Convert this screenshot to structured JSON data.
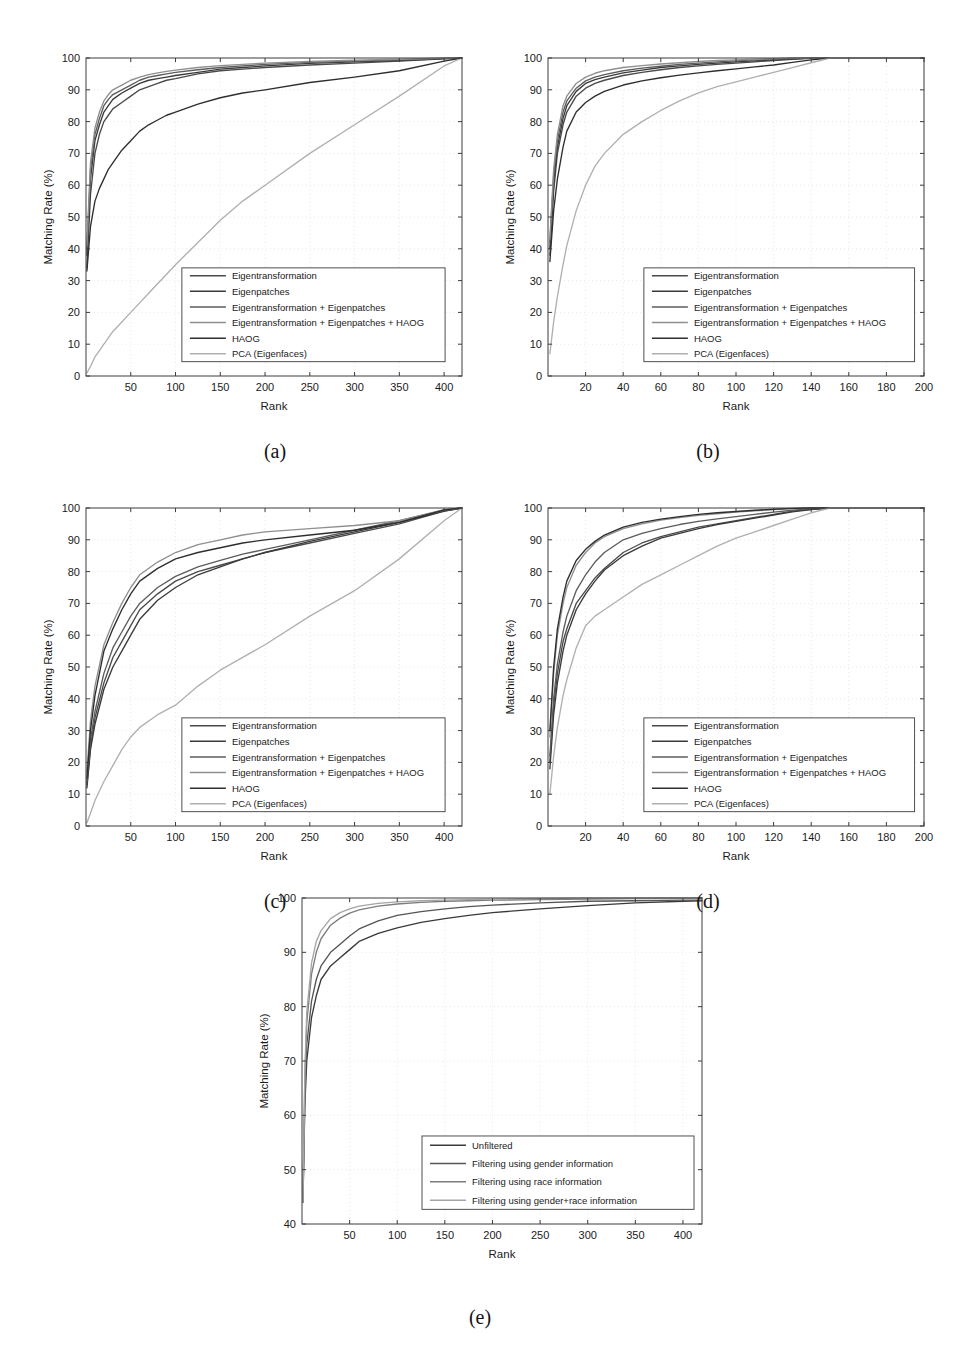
{
  "figure": {
    "background": "#ffffff",
    "axis_color": "#3c3c3c",
    "grid_color": "#d8d8d8",
    "text_color": "#1a1a1a"
  },
  "captions": {
    "a": "(a)",
    "b": "(b)",
    "c": "(c)",
    "d": "(d)",
    "e": "(e)"
  },
  "series_colors": {
    "eigentransformation": "#4a4a4a",
    "eigenpatches": "#3a3a3a",
    "eigentransformation_eigenpatches": "#5c5c5c",
    "eigentransformation_eigenpatches_haog": "#8f8f8f",
    "haog": "#2e2e2e",
    "pca_eigenfaces": "#b0b0b0",
    "unfiltered": "#3a3a3a",
    "gender": "#555555",
    "race": "#7d7d7d",
    "gender_race": "#a5a5a5"
  },
  "chart_data": [
    {
      "id": "a",
      "type": "line",
      "title": "",
      "xlabel": "Rank",
      "ylabel": "Matching Rate (%)",
      "xlim": [
        0,
        420
      ],
      "ylim": [
        0,
        100
      ],
      "xticks": [
        50,
        100,
        150,
        200,
        250,
        300,
        350,
        400
      ],
      "yticks": [
        0,
        10,
        20,
        30,
        40,
        50,
        60,
        70,
        80,
        90,
        100
      ],
      "grid": true,
      "legend_position": "lower-center",
      "x": [
        1,
        5,
        10,
        15,
        20,
        25,
        30,
        40,
        50,
        60,
        70,
        80,
        90,
        100,
        125,
        150,
        175,
        200,
        250,
        300,
        350,
        400,
        420
      ],
      "series": [
        {
          "name": "Eigentransformation",
          "color_key": "eigentransformation",
          "values": [
            34,
            57,
            70,
            76,
            80,
            82,
            84,
            86,
            88,
            90,
            91,
            92,
            93,
            93.5,
            95,
            96,
            96.5,
            97,
            97.8,
            98.4,
            99,
            99.7,
            100
          ]
        },
        {
          "name": "Eigenpatches",
          "color_key": "eigenpatches",
          "values": [
            38,
            62,
            74,
            79,
            83,
            85,
            87,
            89,
            90.5,
            92,
            93,
            93.5,
            94,
            94.5,
            95.5,
            96.5,
            97,
            97.5,
            98.3,
            98.8,
            99.2,
            99.8,
            100
          ]
        },
        {
          "name": "Eigentransformation + Eigenpatches",
          "color_key": "eigentransformation_eigenpatches",
          "values": [
            40,
            65,
            76,
            81,
            85,
            87,
            88.5,
            90,
            91.5,
            93,
            94,
            94.5,
            95,
            95.5,
            96.3,
            97,
            97.5,
            98,
            98.6,
            99,
            99.4,
            99.9,
            100
          ]
        },
        {
          "name": "Eigentransformation + Eigenpatches + HAOG",
          "color_key": "eigentransformation_eigenpatches_haog",
          "values": [
            41,
            67,
            78,
            83,
            86.5,
            88.5,
            90,
            91.5,
            93,
            94,
            94.8,
            95.3,
            95.8,
            96.2,
            97,
            97.6,
            98,
            98.4,
            98.9,
            99.3,
            99.6,
            100,
            100
          ]
        },
        {
          "name": "HAOG",
          "color_key": "haog",
          "values": [
            33,
            47,
            55,
            59,
            62,
            65,
            67,
            71,
            74,
            77,
            79,
            80.5,
            82,
            83,
            85.5,
            87.5,
            89,
            90,
            92.3,
            94,
            96,
            99,
            100
          ]
        },
        {
          "name": "PCA (Eigenfaces)",
          "color_key": "pca_eigenfaces",
          "values": [
            1,
            3,
            6,
            8,
            10,
            12,
            14,
            17,
            20,
            23,
            26,
            29,
            32,
            35,
            42,
            49,
            55,
            60,
            70,
            79,
            88,
            97.5,
            100
          ]
        }
      ]
    },
    {
      "id": "b",
      "type": "line",
      "title": "",
      "xlabel": "Rank",
      "ylabel": "Matching Rate (%)",
      "xlim": [
        0,
        200
      ],
      "ylim": [
        0,
        100
      ],
      "xticks": [
        20,
        40,
        60,
        80,
        100,
        120,
        140,
        160,
        180,
        200
      ],
      "yticks": [
        0,
        10,
        20,
        30,
        40,
        50,
        60,
        70,
        80,
        90,
        100
      ],
      "grid": true,
      "legend_position": "lower-center",
      "x": [
        1,
        3,
        5,
        8,
        10,
        15,
        20,
        25,
        30,
        40,
        50,
        60,
        70,
        80,
        90,
        100,
        110,
        120,
        130,
        140,
        150,
        200
      ],
      "series": [
        {
          "name": "Eigentransformation",
          "color_key": "eigentransformation",
          "values": [
            38,
            58,
            70,
            79,
            83,
            88,
            90.5,
            92,
            93,
            94.5,
            95.5,
            96.3,
            97,
            97.5,
            98,
            98.4,
            98.8,
            99.2,
            99.6,
            99.9,
            100,
            100
          ]
        },
        {
          "name": "Eigenpatches",
          "color_key": "eigenpatches",
          "values": [
            40,
            61,
            72,
            81,
            85,
            89.5,
            92,
            93.2,
            94,
            95.3,
            96.2,
            97,
            97.5,
            98,
            98.4,
            98.8,
            99.1,
            99.4,
            99.7,
            100,
            100,
            100
          ]
        },
        {
          "name": "Eigentransformation + Eigenpatches",
          "color_key": "eigentransformation_eigenpatches",
          "values": [
            42,
            63,
            74,
            83,
            86.5,
            90.5,
            92.8,
            94,
            94.8,
            96,
            96.8,
            97.4,
            98,
            98.4,
            98.8,
            99.1,
            99.4,
            99.6,
            99.9,
            100,
            100,
            100
          ]
        },
        {
          "name": "Eigentransformation + Eigenpatches + HAOG",
          "color_key": "eigentransformation_eigenpatches_haog",
          "values": [
            43,
            65,
            76,
            85,
            88,
            92,
            94,
            95.2,
            96,
            97,
            97.6,
            98.1,
            98.5,
            98.9,
            99.2,
            99.4,
            99.6,
            99.8,
            100,
            100,
            100,
            100
          ]
        },
        {
          "name": "HAOG",
          "color_key": "haog",
          "values": [
            36,
            52,
            62,
            72,
            77,
            83,
            86,
            88,
            89.5,
            91.5,
            92.8,
            93.8,
            94.6,
            95.3,
            96,
            96.6,
            97.2,
            97.8,
            98.6,
            99.4,
            100,
            100
          ]
        },
        {
          "name": "PCA (Eigenfaces)",
          "color_key": "pca_eigenfaces",
          "values": [
            7,
            17,
            25,
            35,
            41,
            52,
            60,
            66,
            70,
            76,
            80,
            83.5,
            86.5,
            89,
            91,
            92.5,
            94,
            95.5,
            97,
            98.5,
            100,
            100
          ]
        }
      ]
    },
    {
      "id": "c",
      "type": "line",
      "title": "",
      "xlabel": "Rank",
      "ylabel": "Matching Rate (%)",
      "xlim": [
        0,
        420
      ],
      "ylim": [
        0,
        100
      ],
      "xticks": [
        50,
        100,
        150,
        200,
        250,
        300,
        350,
        400
      ],
      "yticks": [
        0,
        10,
        20,
        30,
        40,
        50,
        60,
        70,
        80,
        90,
        100
      ],
      "grid": true,
      "legend_position": "lower-center",
      "x": [
        1,
        5,
        10,
        20,
        30,
        40,
        50,
        60,
        80,
        100,
        125,
        150,
        175,
        200,
        250,
        300,
        350,
        400,
        420
      ],
      "series": [
        {
          "name": "Eigentransformation",
          "color_key": "eigentransformation",
          "values": [
            13,
            25,
            34,
            45,
            53,
            58,
            63,
            68,
            73,
            77,
            80,
            82,
            84,
            86,
            89,
            92,
            95,
            99,
            100
          ]
        },
        {
          "name": "Eigenpatches",
          "color_key": "eigenpatches",
          "values": [
            12,
            24,
            32,
            43,
            50,
            55,
            60,
            65,
            71,
            75,
            79,
            81.5,
            84,
            86,
            89.5,
            92.5,
            95.5,
            99,
            100
          ]
        },
        {
          "name": "Eigentransformation + Eigenpatches",
          "color_key": "eigentransformation_eigenpatches",
          "values": [
            14,
            27,
            36,
            48,
            56,
            61,
            66,
            70,
            75,
            78.5,
            81.5,
            83.5,
            85.5,
            87,
            90,
            93,
            96,
            99.3,
            100
          ]
        },
        {
          "name": "Eigentransformation + Eigenpatches + HAOG",
          "color_key": "eigentransformation_eigenpatches_haog",
          "values": [
            17,
            33,
            44,
            57,
            64,
            70,
            75,
            79,
            83,
            86,
            88.5,
            90,
            91.5,
            92.5,
            93.5,
            94.5,
            96,
            99.5,
            100
          ]
        },
        {
          "name": "HAOG",
          "color_key": "haog",
          "values": [
            15,
            30,
            41,
            55,
            62,
            68,
            73,
            77,
            81,
            84,
            86,
            87.5,
            89,
            90,
            91.5,
            93,
            95.5,
            99.4,
            100
          ]
        },
        {
          "name": "PCA (Eigenfaces)",
          "color_key": "pca_eigenfaces",
          "values": [
            1,
            4,
            8,
            14,
            19,
            24,
            28,
            31,
            35,
            38,
            44,
            49,
            53,
            57,
            66,
            74,
            84,
            96,
            100
          ]
        }
      ]
    },
    {
      "id": "d",
      "type": "line",
      "title": "",
      "xlabel": "Rank",
      "ylabel": "Matching Rate (%)",
      "xlim": [
        0,
        200
      ],
      "ylim": [
        0,
        100
      ],
      "xticks": [
        20,
        40,
        60,
        80,
        100,
        120,
        140,
        160,
        180,
        200
      ],
      "yticks": [
        0,
        10,
        20,
        30,
        40,
        50,
        60,
        70,
        80,
        90,
        100
      ],
      "grid": true,
      "legend_position": "lower-center",
      "x": [
        1,
        3,
        5,
        8,
        10,
        15,
        20,
        25,
        30,
        40,
        50,
        60,
        70,
        80,
        90,
        100,
        110,
        120,
        130,
        140,
        150,
        200
      ],
      "series": [
        {
          "name": "Eigentransformation",
          "color_key": "eigentransformation",
          "values": [
            20,
            38,
            48,
            58,
            62,
            70,
            74,
            78,
            81,
            86,
            89,
            91,
            92.5,
            94,
            95,
            96,
            97,
            98,
            99,
            99.6,
            100,
            100
          ]
        },
        {
          "name": "Eigenpatches",
          "color_key": "eigenpatches",
          "values": [
            18,
            35,
            45,
            55,
            60,
            68,
            73,
            77,
            80.5,
            85,
            88,
            90.5,
            92,
            93.5,
            94.8,
            95.8,
            96.8,
            97.8,
            98.8,
            99.5,
            100,
            100
          ]
        },
        {
          "name": "Eigentransformation + Eigenpatches",
          "color_key": "eigentransformation_eigenpatches",
          "values": [
            22,
            40,
            51,
            61,
            66,
            74,
            79,
            83,
            86,
            90,
            92,
            93.5,
            94.8,
            95.8,
            96.6,
            97.3,
            98,
            98.7,
            99.3,
            99.8,
            100,
            100
          ]
        },
        {
          "name": "Eigentransformation + Eigenpatches + HAOG",
          "color_key": "eigentransformation_eigenpatches_haog",
          "values": [
            28,
            48,
            60,
            70,
            75,
            82,
            86,
            89,
            91,
            93.5,
            95,
            96.2,
            97,
            97.7,
            98.2,
            98.7,
            99.1,
            99.5,
            99.8,
            100,
            100,
            100
          ]
        },
        {
          "name": "HAOG",
          "color_key": "haog",
          "values": [
            30,
            50,
            62,
            72,
            77,
            83.5,
            87,
            89.5,
            91.5,
            94,
            95.5,
            96.5,
            97.3,
            98,
            98.5,
            98.9,
            99.3,
            99.6,
            99.9,
            100,
            100,
            100
          ]
        },
        {
          "name": "PCA (Eigenfaces)",
          "color_key": "pca_eigenfaces",
          "values": [
            10,
            22,
            31,
            41,
            46,
            56,
            63,
            66,
            68,
            72,
            76,
            79,
            82,
            85,
            88,
            90.5,
            92.5,
            94.5,
            96.5,
            98.5,
            100,
            100
          ]
        }
      ]
    },
    {
      "id": "e",
      "type": "line",
      "title": "",
      "xlabel": "Rank",
      "ylabel": "Matching Rate (%)",
      "xlim": [
        0,
        420
      ],
      "ylim": [
        40,
        100
      ],
      "xticks": [
        50,
        100,
        150,
        200,
        250,
        300,
        350,
        400
      ],
      "yticks": [
        40,
        50,
        60,
        70,
        80,
        90,
        100
      ],
      "grid": true,
      "legend_position": "lower-center",
      "x": [
        1,
        3,
        5,
        10,
        15,
        20,
        30,
        40,
        50,
        60,
        80,
        100,
        125,
        150,
        175,
        200,
        250,
        300,
        350,
        400,
        420
      ],
      "series": [
        {
          "name": "Unfiltered",
          "color_key": "unfiltered",
          "values": [
            44,
            62,
            70,
            78,
            82,
            85,
            87.5,
            89,
            90.5,
            92,
            93.5,
            94.5,
            95.5,
            96.2,
            96.8,
            97.3,
            98,
            98.6,
            99.1,
            99.4,
            99.5
          ]
        },
        {
          "name": "Filtering using gender information",
          "color_key": "gender",
          "values": [
            44,
            64,
            73,
            81,
            85,
            87.5,
            90,
            91.5,
            93,
            94.3,
            95.8,
            96.8,
            97.5,
            98,
            98.4,
            98.7,
            99.1,
            99.4,
            99.5,
            99.6,
            99.6
          ]
        },
        {
          "name": "Filtering using race information",
          "color_key": "race",
          "values": [
            44,
            67,
            77,
            86,
            90,
            92.5,
            95,
            96.3,
            97.2,
            97.8,
            98.5,
            98.9,
            99.2,
            99.4,
            99.5,
            99.6,
            99.7,
            99.8,
            99.9,
            100,
            100
          ]
        },
        {
          "name": "Filtering using gender+race information",
          "color_key": "gender_race",
          "values": [
            44,
            68,
            79,
            88,
            92,
            94,
            96.2,
            97.3,
            98,
            98.5,
            99,
            99.3,
            99.5,
            99.6,
            99.7,
            99.8,
            99.9,
            100,
            100,
            100,
            100
          ]
        }
      ]
    }
  ]
}
